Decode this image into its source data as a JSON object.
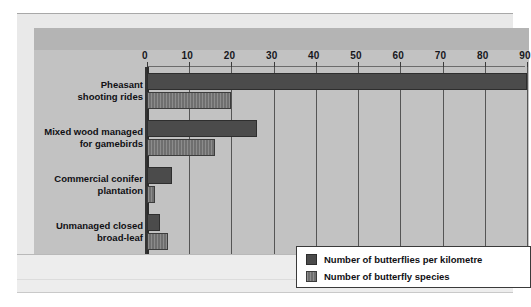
{
  "page": {
    "top_text_fragment": "",
    "margin_fragments": [
      "",
      "",
      "",
      "",
      "",
      "",
      "",
      "",
      "",
      "",
      "",
      "",
      "",
      "",
      "",
      "",
      "",
      "",
      "",
      "",
      "",
      "",
      "",
      ""
    ]
  },
  "legend": {
    "items": [
      {
        "label": "Number of butterflies per kilometre",
        "swatch": "dark",
        "color": "#4b4b4b"
      },
      {
        "label": "Number of butterfly species",
        "swatch": "hatch",
        "color": "#6f6f6f"
      }
    ]
  },
  "chart_data": {
    "type": "bar",
    "orientation": "horizontal",
    "title": "",
    "xlabel": "",
    "ylabel": "",
    "xlim": [
      0,
      90
    ],
    "xticks": [
      0,
      10,
      20,
      30,
      40,
      50,
      60,
      70,
      80,
      90
    ],
    "xtick_labels": [
      "0",
      "10",
      "20",
      "30",
      "40",
      "50",
      "60",
      "70",
      "80",
      "90"
    ],
    "grid": true,
    "legend_position": "inside-bottom-right",
    "categories": [
      "Pheasant shooting rides",
      "Mixed wood managed for gamebirds",
      "Commercial conifer plantation",
      "Unmanaged closed broad-leaf"
    ],
    "category_lines": [
      [
        "Pheasant",
        "shooting rides"
      ],
      [
        "Mixed wood managed",
        "for gamebirds"
      ],
      [
        "Commercial conifer",
        "plantation"
      ],
      [
        "Unmanaged closed",
        "broad-leaf"
      ]
    ],
    "series": [
      {
        "name": "Number of butterflies per kilometre",
        "color": "#4b4b4b",
        "values": [
          90,
          26,
          6,
          3
        ]
      },
      {
        "name": "Number of butterfly species",
        "color": "#6f6f6f",
        "values": [
          20,
          16,
          2,
          5
        ]
      }
    ]
  }
}
